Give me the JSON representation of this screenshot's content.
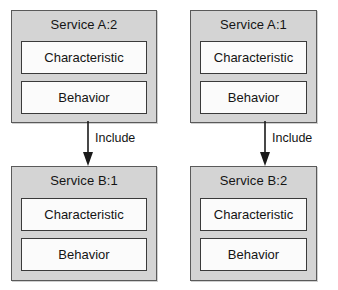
{
  "diagram": {
    "colors": {
      "service_box_fill": "#d4d4d4",
      "service_box_border": "#5a5a5a",
      "compartment_fill": "#fbfbfb",
      "compartment_border": "#3a3a3a",
      "arrow": "#1a1a1a",
      "text": "#141414",
      "background": "#ffffff"
    },
    "compartment_labels": {
      "characteristic": "Characteristic",
      "behavior": "Behavior"
    },
    "services": [
      {
        "id": "service-a2",
        "title": "Service A:2",
        "characteristic": "Characteristic",
        "behavior": "Behavior"
      },
      {
        "id": "service-a1",
        "title": "Service A:1",
        "characteristic": "Characteristic",
        "behavior": "Behavior"
      },
      {
        "id": "service-b1",
        "title": "Service B:1",
        "characteristic": "Characteristic",
        "behavior": "Behavior"
      },
      {
        "id": "service-b2",
        "title": "Service B:2",
        "characteristic": "Characteristic",
        "behavior": "Behavior"
      }
    ],
    "relationships": [
      {
        "id": "include-left",
        "label": "Include",
        "from": "Service A:2",
        "to": "Service B:1",
        "direction": "down"
      },
      {
        "id": "include-right",
        "label": "Include",
        "from": "Service A:1",
        "to": "Service B:2",
        "direction": "down"
      }
    ]
  }
}
